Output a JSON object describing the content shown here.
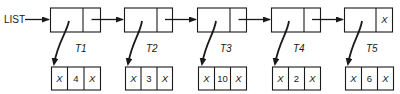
{
  "diagram": {
    "type": "linked-list-of-trees",
    "head_label": "LIST",
    "nodes": [
      {
        "label": "T1",
        "next_cell": "",
        "leaf": {
          "left": "X",
          "value": "4",
          "right": "X"
        }
      },
      {
        "label": "T2",
        "next_cell": "",
        "leaf": {
          "left": "X",
          "value": "3",
          "right": "X"
        }
      },
      {
        "label": "T3",
        "next_cell": "",
        "leaf": {
          "left": "X",
          "value": "10",
          "right": "X"
        }
      },
      {
        "label": "T4",
        "next_cell": "",
        "leaf": {
          "left": "X",
          "value": "2",
          "right": "X"
        }
      },
      {
        "label": "T5",
        "next_cell": "X",
        "leaf": {
          "left": "X",
          "value": "6",
          "right": "X"
        }
      }
    ],
    "colors": {
      "stroke": "#1a1a1a",
      "background": "#ffffff"
    }
  }
}
